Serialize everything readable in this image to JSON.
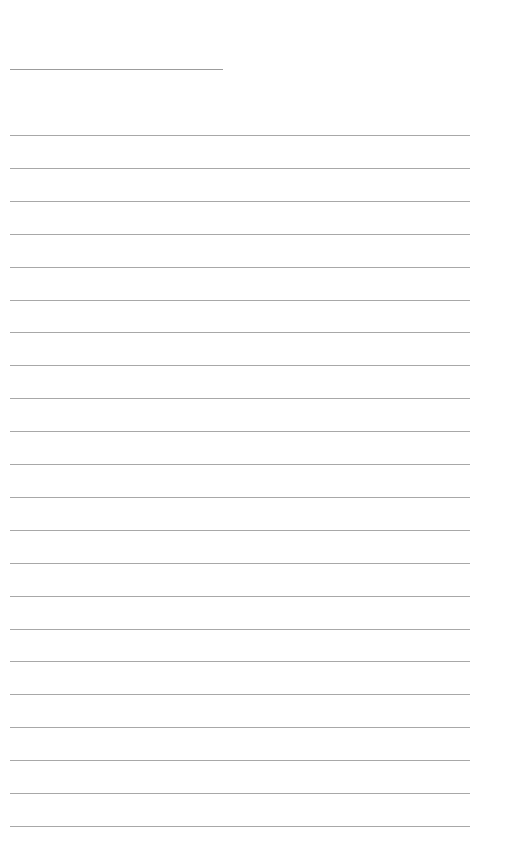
{
  "page": {
    "type": "blank lined sheet",
    "background_color": "#ffffff",
    "line_color": "#a8a8a8"
  },
  "header_line": {
    "left": 10,
    "top": 69,
    "width": 213
  },
  "ruled_lines": {
    "count": 22,
    "first_top": 135,
    "spacing": 32.9,
    "left": 10,
    "width": 460
  }
}
